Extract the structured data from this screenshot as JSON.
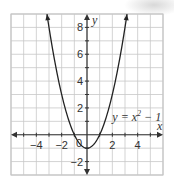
{
  "chart_data": {
    "type": "line",
    "title": "",
    "xlabel": "x",
    "ylabel": "y",
    "xlim": [
      -6,
      6
    ],
    "ylim": [
      -3,
      9
    ],
    "grid": true,
    "x_ticks": [
      -4,
      -2,
      0,
      2,
      4
    ],
    "x_tick_labels": [
      "−4",
      "−2",
      "0",
      "2",
      "4"
    ],
    "y_ticks": [
      -2,
      2,
      4,
      6,
      8
    ],
    "y_tick_labels": [
      "−2",
      "2",
      "4",
      "6",
      "8"
    ],
    "series": [
      {
        "name": "y = x² − 1",
        "equation": "y = x^2 - 1",
        "x": [
          -3.16,
          -3,
          -2,
          -1,
          0,
          1,
          2,
          3,
          3.16
        ],
        "y": [
          9,
          8,
          3,
          0,
          -1,
          0,
          3,
          8,
          9
        ]
      }
    ],
    "annotations": [
      {
        "text": "y = x² − 1",
        "x": 2.0,
        "y": 1.3
      }
    ]
  },
  "labels": {
    "x_axis": "x",
    "y_axis": "y",
    "origin": "0",
    "curve_label_y": "y",
    "curve_label_eq": " = x",
    "curve_label_exp": "2",
    "curve_label_tail": " − 1"
  }
}
